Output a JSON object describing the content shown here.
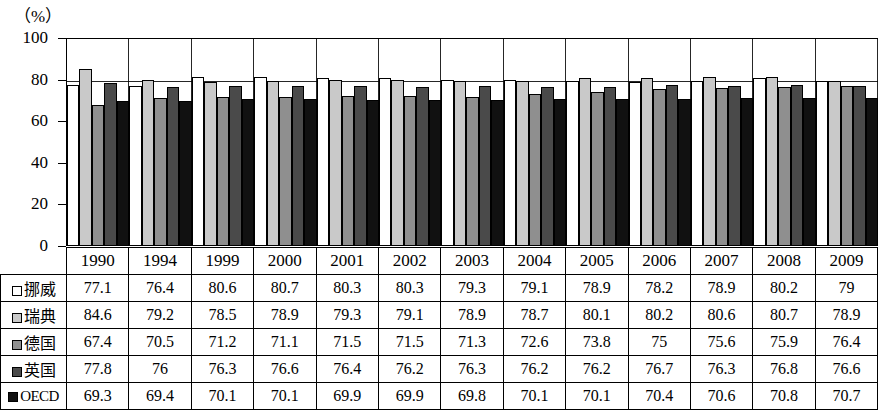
{
  "axis": {
    "unit_label": "（%）",
    "y_ticks": [
      0,
      20,
      40,
      60,
      80,
      100
    ],
    "y_min": 0,
    "y_max": 100
  },
  "legend": [
    {
      "name": "挪威",
      "swatch": "white-square-icon",
      "fill": "#ffffff"
    },
    {
      "name": "瑞典",
      "swatch": "light-gray-square-icon",
      "fill": "#c9c9c9"
    },
    {
      "name": "德国",
      "swatch": "medium-gray-square-icon",
      "fill": "#8f8f8f"
    },
    {
      "name": "英国",
      "swatch": "dark-gray-square-icon",
      "fill": "#4a4a4a"
    },
    {
      "name": "OECD",
      "swatch": "black-square-icon",
      "fill": "#111111"
    }
  ],
  "chart_data": {
    "type": "bar",
    "title": "",
    "xlabel": "",
    "ylabel": "（%）",
    "ylim": [
      0,
      100
    ],
    "grid": true,
    "legend_position": "row-labels-left",
    "categories": [
      "1990",
      "1994",
      "1999",
      "2000",
      "2001",
      "2002",
      "2003",
      "2004",
      "2005",
      "2006",
      "2007",
      "2008",
      "2009"
    ],
    "series": [
      {
        "name": "挪威",
        "values": [
          77.1,
          76.4,
          80.6,
          80.7,
          80.3,
          80.3,
          79.3,
          79.1,
          78.9,
          78.2,
          78.9,
          80.2,
          79
        ]
      },
      {
        "name": "瑞典",
        "values": [
          84.6,
          79.2,
          78.5,
          78.9,
          79.3,
          79.1,
          78.9,
          78.7,
          80.1,
          80.2,
          80.6,
          80.7,
          78.9
        ]
      },
      {
        "name": "德国",
        "values": [
          67.4,
          70.5,
          71.2,
          71.1,
          71.5,
          71.5,
          71.3,
          72.6,
          73.8,
          75,
          75.6,
          75.9,
          76.4
        ]
      },
      {
        "name": "英国",
        "values": [
          77.8,
          76,
          76.3,
          76.6,
          76.4,
          76.2,
          76.3,
          76.2,
          76.2,
          76.7,
          76.3,
          76.8,
          76.6
        ]
      },
      {
        "name": "OECD",
        "values": [
          69.3,
          69.4,
          70.1,
          70.1,
          69.9,
          69.9,
          69.8,
          70.1,
          70.1,
          70.4,
          70.6,
          70.8,
          70.7
        ]
      }
    ]
  }
}
